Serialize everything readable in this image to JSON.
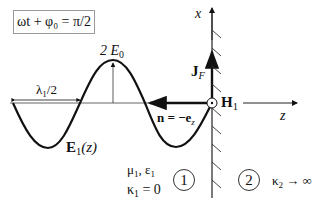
{
  "phase_box": {
    "text": "ωt + φ₀ = π/2"
  },
  "labels": {
    "amplitude": "2 E",
    "amplitude_sub": "0",
    "half_wavelength": "λ",
    "half_wavelength_sub": "1",
    "half_wavelength_suffix": "/2",
    "field_curve": "E",
    "field_curve_sub": "1",
    "field_curve_arg": "(z)",
    "normal": "n = −e",
    "normal_sub": "z",
    "current": "J",
    "current_sub": "F",
    "magnetic": "H",
    "magnetic_sub": "1",
    "axis_x": "x",
    "axis_z": "z",
    "medium1_params": "μ",
    "medium1_params_sub": "1",
    "medium1_eps": ", ε",
    "medium1_eps_sub": "1",
    "medium1_kappa": "κ",
    "medium1_kappa_sub": "1",
    "medium1_kappa_val": " = 0",
    "medium2_kappa": "κ",
    "medium2_kappa_sub": "2",
    "medium2_kappa_val": " → ∞",
    "region1": "1",
    "region2": "2"
  },
  "colors": {
    "stroke": "#111111",
    "box_border": "#9a9a9a"
  }
}
